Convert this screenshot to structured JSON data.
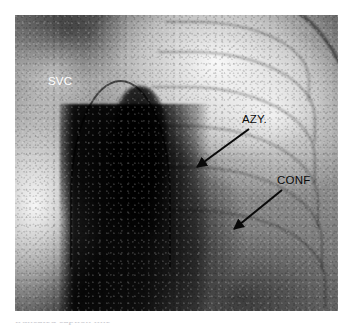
{
  "figure": {
    "kind": "chest-radiograph",
    "modality_label": "radiograph",
    "alt": "Chest radiograph showing the superior vena cava, azygos vein and their confluence"
  },
  "annotations": [
    {
      "id": "svc",
      "label": "SVC",
      "meaning": "superior vena cava",
      "text_color": "#ffffff",
      "has_arrow": false,
      "x": 48,
      "y": 76
    },
    {
      "id": "azy",
      "label": "AZY.",
      "meaning": "azygos vein",
      "text_color": "#0a0a0a",
      "has_arrow": true,
      "x": 242,
      "y": 114,
      "arrow": {
        "x1": 249,
        "y1": 129,
        "x2": 197,
        "y2": 167
      }
    },
    {
      "id": "conf",
      "label": "CONF",
      "meaning": "confluence",
      "text_color": "#0a0a0a",
      "has_arrow": true,
      "x": 277,
      "y": 175,
      "arrow": {
        "x1": 282,
        "y1": 190,
        "x2": 234,
        "y2": 229
      }
    }
  ],
  "caption": {
    "text": "truncated caption line"
  },
  "colors": {
    "page_background": "#ffffff",
    "film_midtone": "#8d8d8d",
    "annotation_dark": "#0a0a0a",
    "annotation_light": "#ffffff"
  }
}
